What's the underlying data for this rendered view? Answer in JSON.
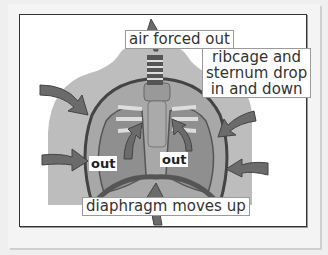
{
  "diagram": {
    "topic": "exhalation",
    "labels": {
      "air": "air forced out",
      "ribcage_line1": "ribcage and",
      "ribcage_line2": "sternum drop",
      "ribcage_line3": "in and down",
      "diaphragm": "diaphragm moves up",
      "out_left": "out",
      "out_right": "out"
    },
    "colors": {
      "background": "#efefef",
      "frame_border": "#333333",
      "torso": "#b3b3b3",
      "lung": "#9a9a9a",
      "arrow": "#6b6b6b",
      "label_border": "#9a9a9a"
    }
  }
}
